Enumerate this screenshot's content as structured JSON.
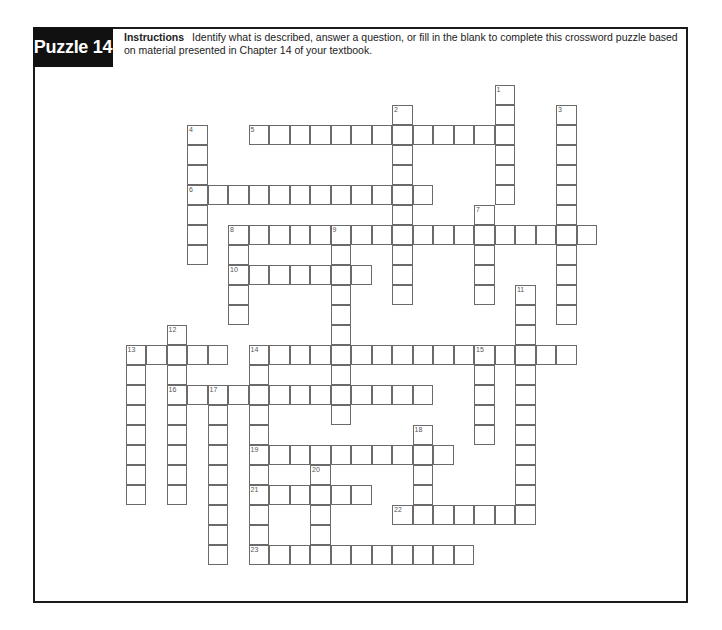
{
  "header": {
    "title": "Puzzle 14",
    "instructions_label": "Instructions",
    "instructions_text": "Identify what is described, answer a question, or fill in the blank to complete this crossword puzzle based on material presented in Chapter 14 of your textbook."
  },
  "grid": {
    "origin_x": 187,
    "origin_y": 85,
    "cell_w": 20.5,
    "cell_h": 20
  },
  "words": [
    {
      "number": 1,
      "direction": "down",
      "col": 15,
      "row": 0,
      "length": 6
    },
    {
      "number": 2,
      "direction": "down",
      "col": 10,
      "row": 1,
      "length": 10
    },
    {
      "number": 3,
      "direction": "down",
      "col": 18,
      "row": 1,
      "length": 11
    },
    {
      "number": 4,
      "direction": "down",
      "col": 0,
      "row": 2,
      "length": 7
    },
    {
      "number": 5,
      "direction": "across",
      "col": 3,
      "row": 2,
      "length": 13
    },
    {
      "number": 6,
      "direction": "across",
      "col": 0,
      "row": 5,
      "length": 12
    },
    {
      "number": 7,
      "direction": "down",
      "col": 14,
      "row": 6,
      "length": 5
    },
    {
      "number": 8,
      "direction": "across",
      "col": 2,
      "row": 7,
      "length": 18
    },
    {
      "number": 8,
      "direction": "down",
      "col": 2,
      "row": 7,
      "length": 5
    },
    {
      "number": 9,
      "direction": "down",
      "col": 7,
      "row": 7,
      "length": 10
    },
    {
      "number": 10,
      "direction": "across",
      "col": 2,
      "row": 9,
      "length": 7
    },
    {
      "number": 11,
      "direction": "down",
      "col": 16,
      "row": 10,
      "length": 12
    },
    {
      "number": 12,
      "direction": "down",
      "col": -1,
      "row": 12,
      "length": 9
    },
    {
      "number": 13,
      "direction": "across",
      "col": -3,
      "row": 13,
      "length": 5
    },
    {
      "number": 13,
      "direction": "down",
      "col": -3,
      "row": 13,
      "length": 8
    },
    {
      "number": 14,
      "direction": "across",
      "col": 3,
      "row": 13,
      "length": 16
    },
    {
      "number": 14,
      "direction": "down",
      "col": 3,
      "row": 13,
      "length": 10
    },
    {
      "number": 15,
      "direction": "down",
      "col": 14,
      "row": 13,
      "length": 5
    },
    {
      "number": 16,
      "direction": "across",
      "col": -1,
      "row": 15,
      "length": 13
    },
    {
      "number": 17,
      "direction": "down",
      "col": 1,
      "row": 15,
      "length": 9
    },
    {
      "number": 18,
      "direction": "down",
      "col": 11,
      "row": 17,
      "length": 5
    },
    {
      "number": 19,
      "direction": "across",
      "col": 3,
      "row": 18,
      "length": 10
    },
    {
      "number": 20,
      "direction": "down",
      "col": 6,
      "row": 19,
      "length": 5
    },
    {
      "number": 21,
      "direction": "across",
      "col": 3,
      "row": 20,
      "length": 6
    },
    {
      "number": 22,
      "direction": "across",
      "col": 10,
      "row": 21,
      "length": 7
    },
    {
      "number": 23,
      "direction": "across",
      "col": 3,
      "row": 23,
      "length": 11
    }
  ]
}
